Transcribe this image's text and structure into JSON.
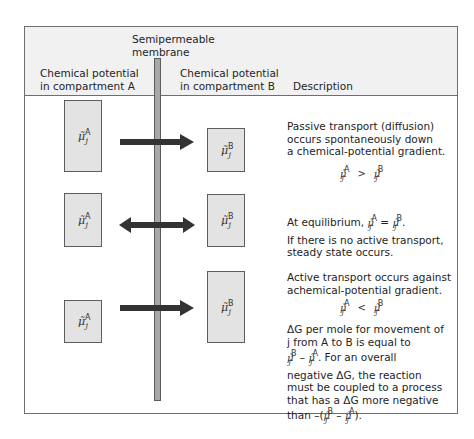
{
  "header": {
    "membrane_label_line1": "Semipermeable",
    "membrane_label_line2": "membrane",
    "col_a_line1": "Chemical potential",
    "col_a_line2": "in compartment A",
    "col_b_line1": "Chemical potential",
    "col_b_line2": "in compartment B",
    "col_desc": "Description"
  },
  "symbols": {
    "mu": "μ̃",
    "sub": "j",
    "sup_a": "A",
    "sup_b": "B"
  },
  "rows": [
    {
      "arrow": "right-arrow",
      "desc_lines": [
        "Passive transport (diffusion)",
        "occurs spontaneously down",
        "a chemical-potential gradient."
      ],
      "relation": ">"
    },
    {
      "arrow": "double-arrow",
      "desc_line1_prefix": "At equilibrium,",
      "relation": "=",
      "desc_line1_suffix": ".",
      "desc_lines": [
        "If there is no active transport,",
        "steady state occurs."
      ]
    },
    {
      "arrow": "right-arrow",
      "desc_lines": [
        "Active transport occurs against",
        "achemical-potential gradient."
      ],
      "relation": "<",
      "extra_lines": {
        "l1": "ΔG per mole for movement of",
        "l2": "j from A to B is equal to",
        "l3_suffix": ". For an overall",
        "l4": "negative ΔG, the reaction",
        "l5": "must be coupled to a process",
        "l6": "that has a ΔG more negative",
        "l7_prefix": "than –(",
        "l7_minus": " – ",
        "l7_suffix": ")."
      }
    }
  ],
  "colors": {
    "header_bg": "#f1f1f1",
    "box_fill": "#e3e3e3",
    "membrane_fill": "#a8a8a8",
    "arrow": "#333333",
    "border": "#6e6e6e"
  }
}
